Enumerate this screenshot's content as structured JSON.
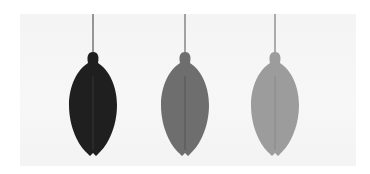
{
  "scene": {
    "description": "Three hanging teardrop-shaped bulbs in graduated shades",
    "background_color": "#ffffff",
    "backdrop_color": "#f5f5f5",
    "items": [
      {
        "name": "dark-bulb",
        "center_x": 93,
        "color": "#1f1f1f",
        "seam_color": "#3a3a3a",
        "string_color": "#555555"
      },
      {
        "name": "medium-bulb",
        "center_x": 185,
        "color": "#6e6e6e",
        "seam_color": "#4e4e4e",
        "string_color": "#6a6a6a"
      },
      {
        "name": "light-bulb",
        "center_x": 275,
        "color": "#9c9c9c",
        "seam_color": "#858585",
        "string_color": "#7a7a7a"
      }
    ]
  }
}
